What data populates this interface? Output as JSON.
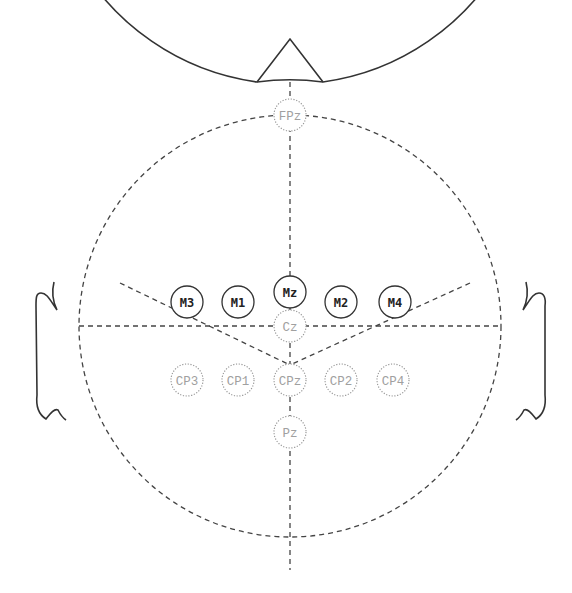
{
  "diagram": {
    "title": "",
    "type": "eeg-electrode-layout",
    "colors": {
      "outline": "#333333",
      "active_text": "#222222",
      "inactive_text": "#a0a0a0",
      "inactive_ring": "#999999"
    },
    "active_electrodes": [
      {
        "label": "M3",
        "cx": 187,
        "cy": 302
      },
      {
        "label": "M1",
        "cx": 238,
        "cy": 302
      },
      {
        "label": "Mz",
        "cx": 290,
        "cy": 292
      },
      {
        "label": "M2",
        "cx": 341,
        "cy": 302
      },
      {
        "label": "M4",
        "cx": 395,
        "cy": 302
      }
    ],
    "inactive_electrodes": [
      {
        "label": "FPz",
        "cx": 290,
        "cy": 115
      },
      {
        "label": "Cz",
        "cx": 290,
        "cy": 326
      },
      {
        "label": "CP3",
        "cx": 187,
        "cy": 380
      },
      {
        "label": "CP1",
        "cx": 238,
        "cy": 380
      },
      {
        "label": "CPz",
        "cx": 290,
        "cy": 380
      },
      {
        "label": "CP2",
        "cx": 341,
        "cy": 380
      },
      {
        "label": "CP4",
        "cx": 393,
        "cy": 380
      },
      {
        "label": "Pz",
        "cx": 290,
        "cy": 432
      }
    ]
  }
}
